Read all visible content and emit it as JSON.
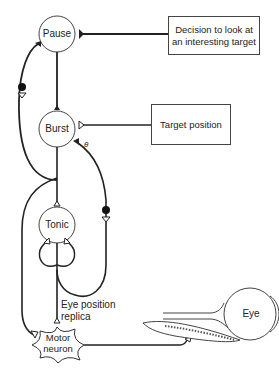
{
  "nodes": {
    "pause": "Pause",
    "burst": "Burst",
    "tonic": "Tonic",
    "motor_neuron_line1": "Motor",
    "motor_neuron_line2": "neuron",
    "eye": "Eye"
  },
  "inputs": {
    "decision_line1": "Decision to look at",
    "decision_line2": "an interesting target",
    "target_position": "Target position"
  },
  "annotations": {
    "eye_position_line1": "Eye position",
    "eye_position_line2": "replica",
    "theta": "θ"
  },
  "colors": {
    "stroke": "#222222",
    "background": "#ffffff"
  }
}
